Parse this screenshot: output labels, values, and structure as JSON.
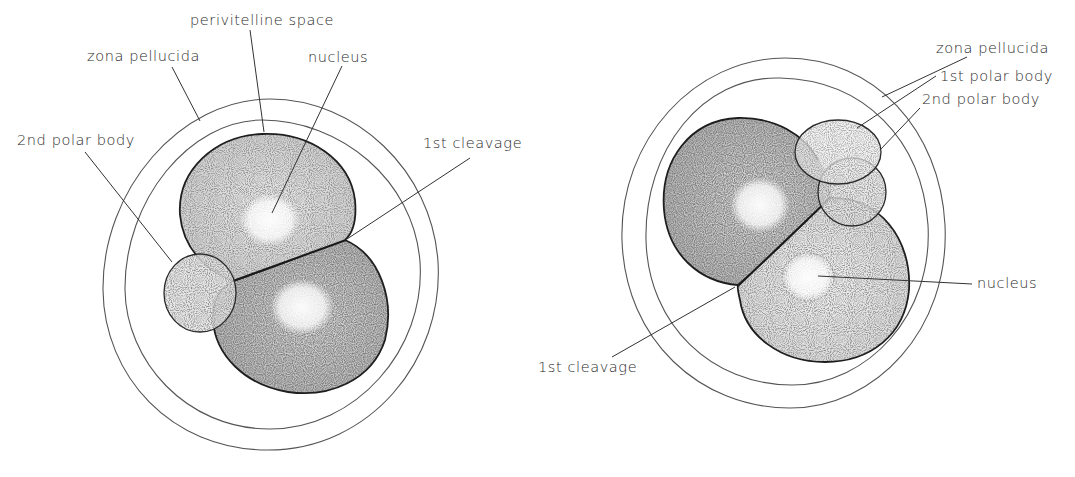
{
  "figure": {
    "background": "#ffffff",
    "ink_color": "#222222",
    "stipple_color": "#6a6a6a"
  },
  "left_embryo": {
    "labels": {
      "perivitelline_space": "perivitelline space",
      "zona_pellucida": "zona pellucida",
      "nucleus": "nucleus",
      "second_polar_body": "2nd polar body",
      "first_cleavage": "1st cleavage"
    }
  },
  "right_embryo": {
    "labels": {
      "zona_pellucida": "zona pellucida",
      "first_polar_body": "1st polar body",
      "second_polar_body": "2nd polar body",
      "nucleus": "nucleus",
      "first_cleavage": "1st cleavage"
    }
  }
}
